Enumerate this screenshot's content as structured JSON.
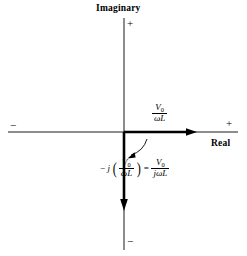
{
  "figure": {
    "title_note": "complex-plane phasor diagram",
    "background_color": "#ffffff",
    "stroke_color": "#000000",
    "width": 247,
    "height": 256
  },
  "axes": {
    "vertical": {
      "name": "Imaginary",
      "positive_sign": "+",
      "negative_sign": "−"
    },
    "horizontal": {
      "name": "Real",
      "positive_sign": "+",
      "negative_sign": "−"
    },
    "origin": {
      "x": 124,
      "y": 132
    }
  },
  "phasors": [
    {
      "id": "real-phasor",
      "direction": "positive-real",
      "label": {
        "numerator": "V",
        "numerator_sub": "0",
        "denominator_omega": "ω",
        "denominator_L": "L",
        "plain": "V0/(ωL)"
      },
      "tip": {
        "x": 197,
        "y": 132
      }
    },
    {
      "id": "imaginary-phasor",
      "direction": "negative-imaginary",
      "tip": {
        "x": 124,
        "y": 210
      }
    }
  ],
  "rotation_arc": {
    "id": "minus-90-rotation",
    "from": "positive-real",
    "to": "negative-imaginary",
    "degrees": "−90"
  },
  "equation": {
    "minus": "−",
    "j": "j",
    "open_paren": "(",
    "close_paren": ")",
    "lhs_numerator": "V",
    "lhs_numerator_sub": "0",
    "lhs_denominator_omega": "ω",
    "lhs_denominator_L": "L",
    "equals": "=",
    "rhs_numerator": "V",
    "rhs_numerator_sub": "0",
    "rhs_denominator_j": "j",
    "rhs_denominator_omega": "ω",
    "rhs_denominator_L": "L",
    "plain": "−j(V0/ωL) = V0/(jωL)"
  }
}
